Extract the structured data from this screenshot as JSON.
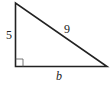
{
  "diagram": {
    "type": "right-triangle",
    "labels": {
      "vertical_leg": "5",
      "hypotenuse": "9",
      "horizontal_leg": "b"
    },
    "right_angle_marker": true,
    "stroke_color": "#222222",
    "background": "#ffffff"
  }
}
